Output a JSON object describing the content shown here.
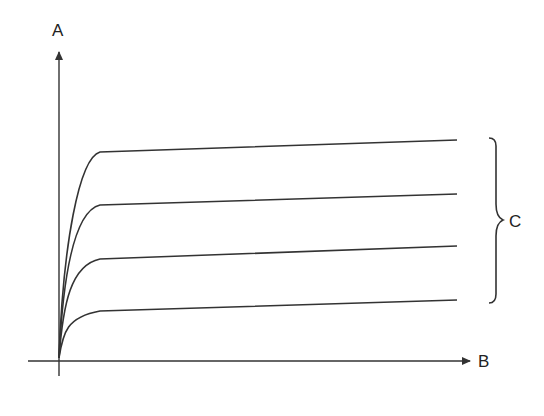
{
  "diagram": {
    "type": "family-of-curves",
    "y_axis_label": "A",
    "x_axis_label": "B",
    "bracket_label": "C",
    "curve_count": 4,
    "curves": [
      {
        "name": "curve-1",
        "level_rank": 1
      },
      {
        "name": "curve-2",
        "level_rank": 2
      },
      {
        "name": "curve-3",
        "level_rank": 3
      },
      {
        "name": "curve-4",
        "level_rank": 4
      }
    ],
    "colors": {
      "stroke": "#333333",
      "text": "#222222",
      "background": "#ffffff"
    }
  }
}
